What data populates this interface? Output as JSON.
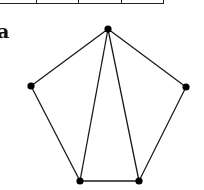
{
  "figure_label": "a",
  "table_fragment": {
    "dividers_x": [
      36,
      78,
      121
    ]
  },
  "graph": {
    "vertices": [
      {
        "id": "top",
        "x": 108,
        "y": 29
      },
      {
        "id": "right",
        "x": 186,
        "y": 87
      },
      {
        "id": "bottom-right",
        "x": 139,
        "y": 181
      },
      {
        "id": "bottom-left",
        "x": 80,
        "y": 181
      },
      {
        "id": "left",
        "x": 31,
        "y": 86
      }
    ],
    "edges": [
      [
        "top",
        "right"
      ],
      [
        "right",
        "bottom-right"
      ],
      [
        "bottom-right",
        "bottom-left"
      ],
      [
        "bottom-left",
        "left"
      ],
      [
        "left",
        "top"
      ],
      [
        "top",
        "bottom-left"
      ],
      [
        "top",
        "bottom-right"
      ]
    ],
    "colors": {
      "stroke": "#1a1a1a",
      "vertex": "#000000"
    }
  }
}
